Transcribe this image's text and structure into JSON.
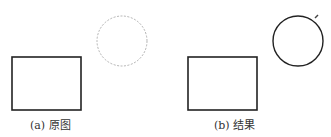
{
  "panels": [
    {
      "id": "a",
      "caption": "(a) 原图",
      "rectangle": {
        "x": 12,
        "y": 57,
        "width": 69,
        "height": 53,
        "stroke": "#222222",
        "style": "solid"
      },
      "circle": {
        "cx": 122,
        "cy": 41,
        "r": 25,
        "stroke": "#9a9a9a",
        "style": "dashed"
      }
    },
    {
      "id": "b",
      "caption": "(b) 结果",
      "rectangle": {
        "x": 188,
        "y": 57,
        "width": 69,
        "height": 53,
        "stroke": "#222222",
        "style": "solid"
      },
      "circle": {
        "cx": 298,
        "cy": 41,
        "r": 25,
        "stroke": "#222222",
        "style": "solid"
      },
      "marker": {
        "x": 317,
        "y": 16,
        "label": "selection-handle"
      }
    }
  ]
}
